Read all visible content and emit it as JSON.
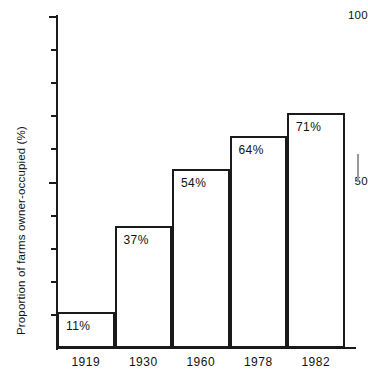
{
  "chart_data": {
    "type": "bar",
    "title": "",
    "subtitle": "",
    "xlabel": "",
    "ylabel": "Proportion of farms owner-occupied (%)",
    "categories": [
      "1919",
      "1930",
      "1960",
      "1978",
      "1982"
    ],
    "values": [
      11,
      37,
      54,
      64,
      71
    ],
    "value_labels": [
      "11%",
      "37%",
      "54%",
      "64%",
      "71%"
    ],
    "ylim": [
      0,
      100
    ],
    "xlim_note": "categorical, contiguous bars",
    "y_tick_values": [
      0,
      10,
      20,
      30,
      40,
      50,
      60,
      70,
      80,
      90,
      100
    ],
    "y_tick_labels_shown": [
      "50",
      "100"
    ],
    "y_major_ticks": [
      50,
      100
    ],
    "grid": false,
    "legend": null,
    "legend_position": "none",
    "series": [
      {
        "name": "Proportion of farms owner-occupied",
        "values": [
          11,
          37,
          54,
          64,
          71
        ]
      }
    ],
    "bars": [
      {
        "category": "1919",
        "value": 11,
        "label": "11%"
      },
      {
        "category": "1930",
        "value": 37,
        "label": "37%"
      },
      {
        "category": "1960",
        "value": 54,
        "label": "54%"
      },
      {
        "category": "1978",
        "value": 64,
        "label": "64%"
      },
      {
        "category": "1982",
        "value": 71,
        "label": "71%"
      }
    ],
    "axis_colors": {
      "axis_line": "#1a1a1a",
      "bar_outline": "#1a1a1a",
      "bar_fill": "#ffffff",
      "text": "#111111",
      "background": "#ffffff"
    }
  },
  "axis": {
    "y_label_top": "100",
    "y_label_mid": "50"
  }
}
